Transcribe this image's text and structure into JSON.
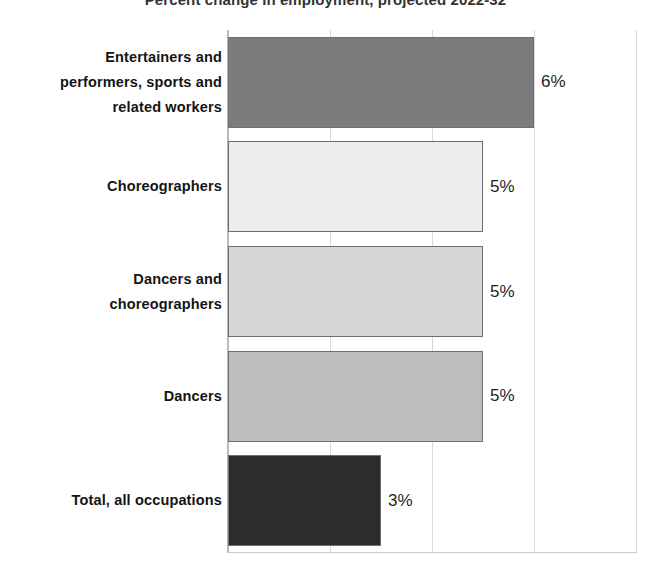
{
  "chart_data": {
    "type": "bar",
    "orientation": "horizontal",
    "title": "Percent change in employment, projected 2022-32",
    "xlabel": "",
    "ylabel": "",
    "xlim": [
      0,
      8
    ],
    "xticks": [
      0,
      2,
      4,
      6,
      8
    ],
    "xtick_labels": [
      "",
      "",
      "",
      "",
      ""
    ],
    "grid": true,
    "legend": "none",
    "unit": "%",
    "categories": [
      "Entertainers and performers, sports and related workers",
      "Choreographers",
      "Dancers and choreographers",
      "Dancers",
      "Total, all occupations"
    ],
    "values": [
      6,
      5,
      5,
      5,
      3
    ],
    "value_labels": [
      "6%",
      "5%",
      "5%",
      "5%",
      "3%"
    ],
    "bar_colors": [
      "#7c7c7c",
      "#ededed",
      "#d5d5d5",
      "#bebebe",
      "#2c2c2c"
    ],
    "bar_border_color": "#6f6f6f"
  },
  "bars": [
    {
      "label_lines": [
        "Entertainers and",
        "performers, sports and",
        "related workers"
      ],
      "value_label": "6%",
      "value": 6,
      "color": "#7c7c7c"
    },
    {
      "label_lines": [
        "Choreographers"
      ],
      "value_label": "5%",
      "value": 5,
      "color": "#ededed"
    },
    {
      "label_lines": [
        "Dancers and",
        "choreographers"
      ],
      "value_label": "5%",
      "value": 5,
      "color": "#d5d5d5"
    },
    {
      "label_lines": [
        "Dancers"
      ],
      "value_label": "5%",
      "value": 5,
      "color": "#bebebe"
    },
    {
      "label_lines": [
        "Total, all occupations"
      ],
      "value_label": "3%",
      "value": 3,
      "color": "#2c2c2c"
    }
  ]
}
